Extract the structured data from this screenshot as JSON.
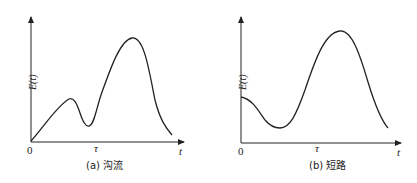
{
  "panels": [
    {
      "id": "a",
      "caption": "(a) 沟流",
      "ylabel": "E(t)",
      "xlabel": "t",
      "origin_label": "0",
      "tau_label": "τ",
      "curve_description": "rises from origin to small peak, dips, then rises to larger peak and falls"
    },
    {
      "id": "b",
      "caption": "(b) 短路",
      "ylabel": "E(t)",
      "xlabel": "t",
      "origin_label": "0",
      "tau_label": "τ",
      "curve_description": "starts at moderate value, dips to minimum, rises to large peak and falls"
    }
  ],
  "colors": {
    "line": "#222222",
    "background": "#ffffff"
  }
}
